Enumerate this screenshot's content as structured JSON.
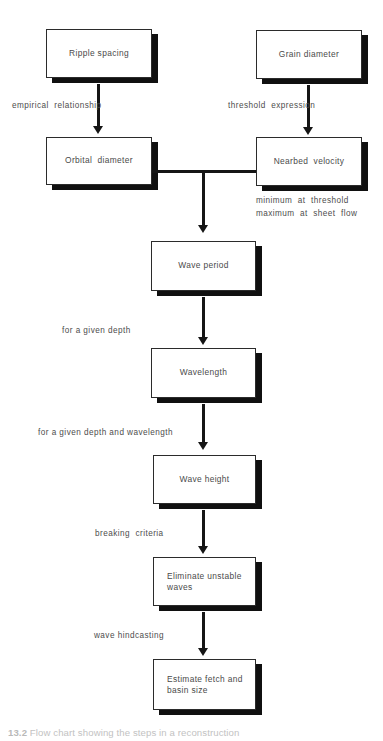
{
  "figure": {
    "type": "flowchart",
    "orientation": "top-to-bottom",
    "caption_number": "13.2",
    "caption_text": "Flow chart showing the steps in a reconstruction"
  },
  "nodes": [
    {
      "id": "ripple-spacing",
      "label": "Ripple spacing",
      "align": "center"
    },
    {
      "id": "grain-diameter",
      "label": "Grain diameter",
      "align": "center"
    },
    {
      "id": "orbital-diameter",
      "label": "Orbital  diameter",
      "align": "center"
    },
    {
      "id": "nearbed-velocity",
      "label": "Nearbed  velocity",
      "align": "center"
    },
    {
      "id": "wave-period",
      "label": "Wave period",
      "align": "center"
    },
    {
      "id": "wavelength",
      "label": "Wavelength",
      "align": "center"
    },
    {
      "id": "wave-height",
      "label": "Wave height",
      "align": "center"
    },
    {
      "id": "eliminate-waves",
      "label": "Eliminate unstable\nwaves",
      "align": "left"
    },
    {
      "id": "estimate-fetch",
      "label": "Estimate fetch and\nbasin size",
      "align": "left"
    }
  ],
  "edge_labels": [
    {
      "id": "empirical-relationship",
      "text": "empirical  relationship"
    },
    {
      "id": "threshold-expression",
      "text": "threshold  expression"
    },
    {
      "id": "minimum-at-threshold",
      "text": "minimum  at  threshold"
    },
    {
      "id": "maximum-at-sheet-flow",
      "text": "maximum  at  sheet  flow"
    },
    {
      "id": "for-a-given-depth",
      "text": "for a given depth"
    },
    {
      "id": "for-a-given-depth-and-wavelength",
      "text": "for a given depth and wavelength"
    },
    {
      "id": "breaking-criteria",
      "text": "breaking  criteria"
    },
    {
      "id": "wave-hindcasting",
      "text": "wave hindcasting"
    }
  ],
  "colors": {
    "box_border": "#2b2b2b",
    "box_fill": "#ffffff",
    "shadow": "#101010",
    "line": "#151515",
    "text": "#4a4a4a",
    "background": "#ffffff"
  }
}
